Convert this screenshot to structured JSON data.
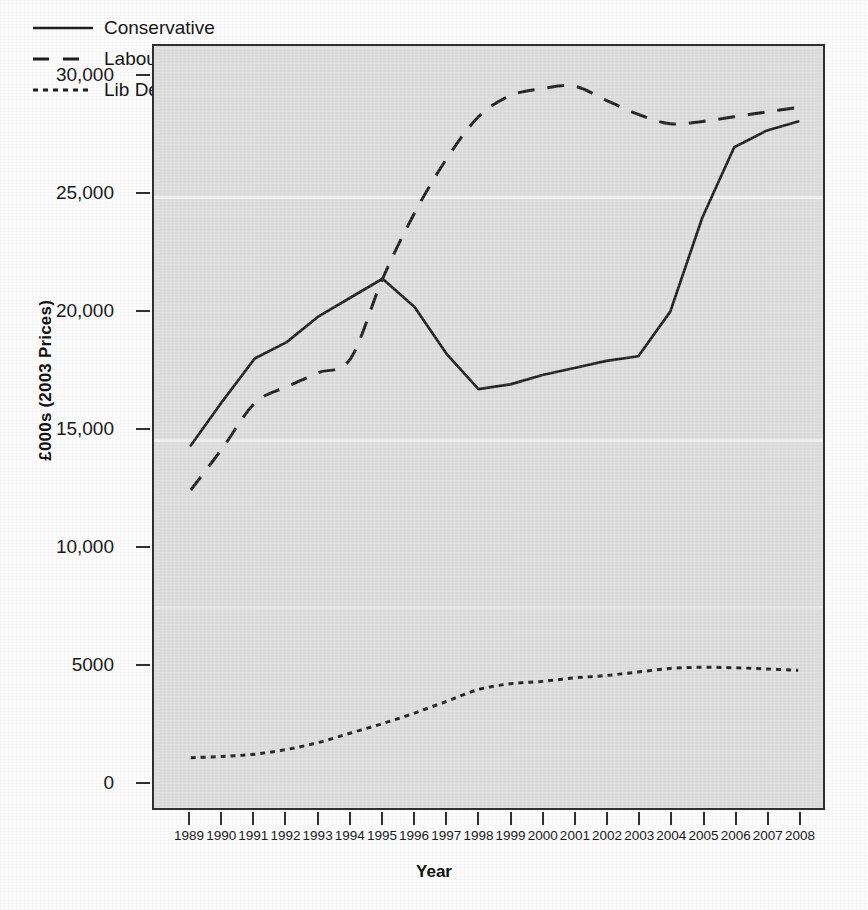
{
  "chart_data": {
    "type": "line",
    "title": "",
    "xlabel": "Year",
    "ylabel": "£000s (2003 Prices)",
    "xlim": [
      1989,
      2008
    ],
    "ylim": [
      0,
      31500
    ],
    "yticks": [
      0,
      5000,
      10000,
      15000,
      20000,
      25000,
      30000
    ],
    "ytick_labels": [
      "0",
      "5000",
      "10,000",
      "15,000",
      "20,000",
      "25,000",
      "30,000"
    ],
    "x": [
      1989,
      1990,
      1991,
      1992,
      1993,
      1994,
      1995,
      1996,
      1997,
      1998,
      1999,
      2000,
      2001,
      2002,
      2003,
      2004,
      2005,
      2006,
      2007,
      2008
    ],
    "xtick_labels": [
      "1989",
      "1990",
      "1991",
      "1992",
      "1993",
      "1994",
      "1995",
      "1996",
      "1997",
      "1998",
      "1999",
      "2000",
      "2001",
      "2002",
      "2003",
      "2004",
      "2005",
      "2006",
      "2007",
      "2008"
    ],
    "grid": false,
    "legend_position": "top-left",
    "series": [
      {
        "name": "Conservative",
        "style": "solid",
        "color": "#1f1f1f",
        "values": [
          14300,
          16200,
          18000,
          18700,
          19800,
          20600,
          21400,
          20200,
          18200,
          16700,
          16900,
          17300,
          17600,
          17900,
          18100,
          20000,
          24000,
          27000,
          27700,
          28100
        ]
      },
      {
        "name": "Labour",
        "style": "dashed",
        "color": "#1f1f1f",
        "values": [
          12400,
          14200,
          16100,
          16800,
          17400,
          18000,
          21400,
          24200,
          26500,
          28300,
          29200,
          29500,
          29600,
          29000,
          28400,
          28000,
          28100,
          28300,
          28500,
          28700
        ]
      },
      {
        "name": "Lib Dem",
        "style": "dotted",
        "color": "#1f1f1f",
        "values": [
          1000,
          1050,
          1150,
          1350,
          1650,
          2050,
          2450,
          2900,
          3400,
          3900,
          4150,
          4250,
          4400,
          4500,
          4650,
          4800,
          4850,
          4830,
          4780,
          4720
        ]
      }
    ]
  },
  "legend": {
    "items": [
      {
        "label": "Conservative",
        "style": "solid"
      },
      {
        "label": "Labour",
        "style": "dashed"
      },
      {
        "label": "Lib Dem",
        "style": "dotted"
      }
    ]
  },
  "page": {
    "ghost_text": " "
  }
}
